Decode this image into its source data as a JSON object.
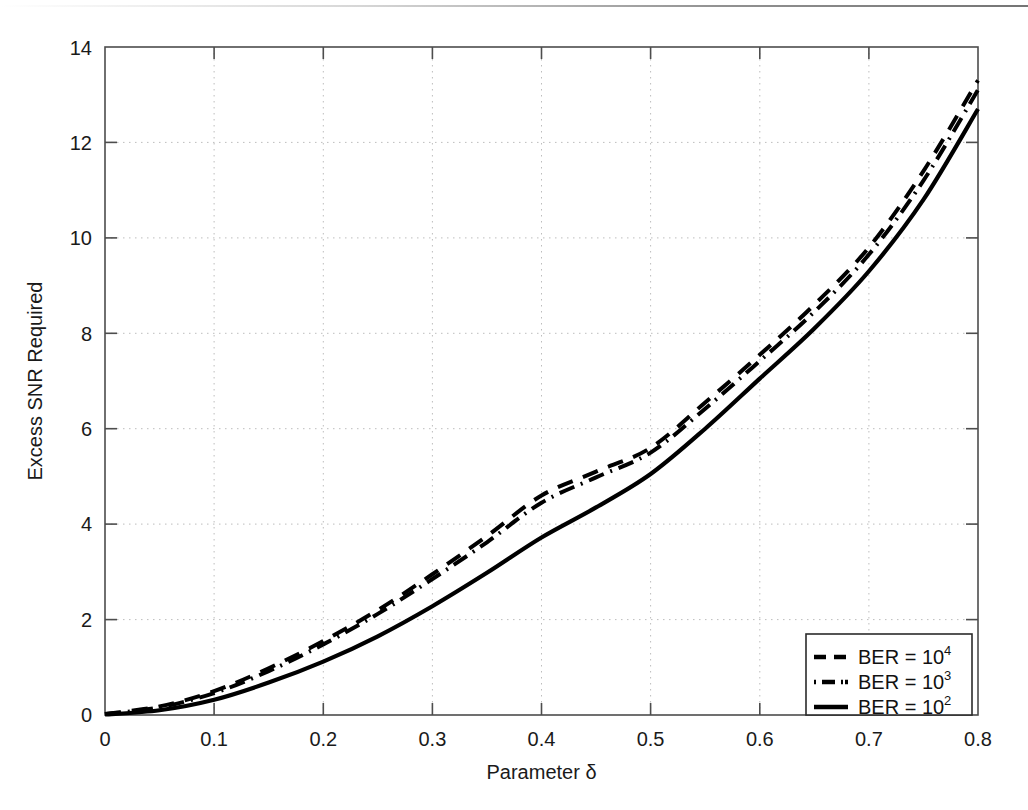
{
  "figure": {
    "background_color": "#ffffff",
    "axis_color": "#4d4d4d",
    "grid_color": "#b9b9b9",
    "curve_color": "#000000"
  },
  "axes": {
    "x_title": "Parameter δ",
    "y_title": "Excess SNR Required",
    "x_ticks": [
      "0",
      "0.1",
      "0.2",
      "0.3",
      "0.4",
      "0.5",
      "0.6",
      "0.7",
      "0.8"
    ],
    "y_ticks": [
      "0",
      "2",
      "4",
      "6",
      "8",
      "10",
      "12",
      "14"
    ]
  },
  "legend": {
    "entries": [
      {
        "label": "BER = 10",
        "exponent": "4",
        "style": "dashed"
      },
      {
        "label": "BER = 10",
        "exponent": "3",
        "style": "dashdot"
      },
      {
        "label": "BER = 10",
        "exponent": "2",
        "style": "solid"
      }
    ]
  },
  "chart_data": {
    "type": "line",
    "title": "",
    "xlabel": "Parameter δ",
    "ylabel": "Excess SNR Required",
    "xlim": [
      0,
      0.8
    ],
    "ylim": [
      0,
      14
    ],
    "xticks": [
      0,
      0.1,
      0.2,
      0.3,
      0.4,
      0.5,
      0.6,
      0.7,
      0.8
    ],
    "yticks": [
      0,
      2,
      4,
      6,
      8,
      10,
      12,
      14
    ],
    "grid": true,
    "legend_position": "lower right",
    "x": [
      0,
      0.05,
      0.1,
      0.15,
      0.2,
      0.25,
      0.3,
      0.35,
      0.4,
      0.45,
      0.5,
      0.55,
      0.6,
      0.65,
      0.7,
      0.75,
      0.8
    ],
    "series": [
      {
        "name": "BER = 10^4",
        "style": "dashed",
        "values": [
          0.02,
          0.18,
          0.5,
          0.98,
          1.55,
          2.2,
          2.95,
          3.75,
          4.6,
          5.1,
          5.6,
          6.55,
          7.55,
          8.6,
          9.8,
          11.4,
          13.3
        ]
      },
      {
        "name": "BER = 10^3",
        "style": "dashdot",
        "values": [
          0.02,
          0.16,
          0.46,
          0.92,
          1.48,
          2.12,
          2.85,
          3.62,
          4.45,
          4.98,
          5.5,
          6.42,
          7.42,
          8.45,
          9.65,
          11.2,
          13.1
        ]
      },
      {
        "name": "BER = 10^2",
        "style": "solid",
        "values": [
          0.01,
          0.1,
          0.32,
          0.68,
          1.12,
          1.65,
          2.28,
          2.98,
          3.72,
          4.35,
          5.05,
          6.0,
          7.05,
          8.1,
          9.3,
          10.8,
          12.7
        ]
      }
    ]
  }
}
